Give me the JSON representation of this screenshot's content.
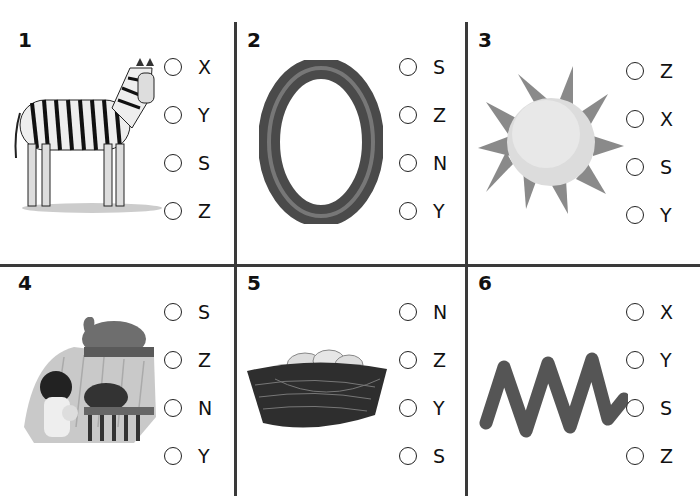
{
  "worksheet": {
    "questions": [
      {
        "number": "1",
        "image": "zebra",
        "options": [
          "X",
          "Y",
          "S",
          "Z"
        ]
      },
      {
        "number": "2",
        "image": "letter-o",
        "options": [
          "S",
          "Z",
          "N",
          "Y"
        ]
      },
      {
        "number": "3",
        "image": "sun",
        "options": [
          "Z",
          "X",
          "S",
          "Y"
        ]
      },
      {
        "number": "4",
        "image": "zoo",
        "options": [
          "S",
          "Z",
          "N",
          "Y"
        ]
      },
      {
        "number": "5",
        "image": "nest",
        "options": [
          "N",
          "Z",
          "Y",
          "S"
        ]
      },
      {
        "number": "6",
        "image": "zigzag",
        "options": [
          "X",
          "Y",
          "S",
          "Z"
        ]
      }
    ]
  },
  "colors": {
    "grid_line": "#3a3a3a",
    "clay_gray": "#6b6b6b",
    "sun_light": "#dcdcdc"
  }
}
